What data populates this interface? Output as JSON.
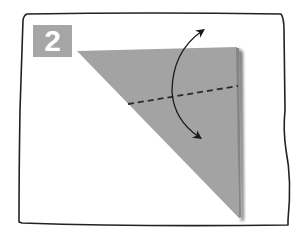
{
  "diagram": {
    "step_number": "2",
    "colors": {
      "paper": "#a3a3a3",
      "paper_shadow": "#7a7a7a",
      "badge": "#a6a6a6",
      "frame": "#222222",
      "fold_line": "#2a2a2a",
      "arrow": "#1a1a1a"
    },
    "elements": {
      "frame": "hand-drawn rectangular border",
      "paper": "right triangle (top edge horizontal, right edge vertical)",
      "fold_line": "dashed valley fold line",
      "arrow": "curved double-headed fold-and-unfold arrow"
    }
  }
}
